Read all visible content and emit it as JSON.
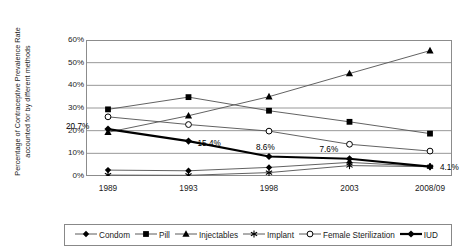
{
  "chart_data": {
    "type": "line",
    "title": "",
    "xlabel": "",
    "ylabel": "Percentage of Contraceptive Prevalence Rate accounted for by different methods",
    "ylabel_line1": "Percentage of Contraceptive Prevalence Rate",
    "ylabel_line2": "accounted for by different methods",
    "categories": [
      "1989",
      "1993",
      "1998",
      "2003",
      "2008/09"
    ],
    "ylim": [
      0,
      60
    ],
    "ytick_values": [
      0,
      10,
      20,
      30,
      40,
      50,
      60
    ],
    "ytick_labels": [
      "0%",
      "10%",
      "20%",
      "30%",
      "40%",
      "50%",
      "60%"
    ],
    "grid": true,
    "legend_position": "bottom",
    "series": [
      {
        "name": "Condom",
        "marker": "diamond",
        "values": [
          2.6,
          2.3,
          3.8,
          6.0,
          4.1
        ]
      },
      {
        "name": "Pill",
        "marker": "square",
        "values": [
          29.4,
          34.8,
          28.8,
          23.9,
          18.7
        ]
      },
      {
        "name": "Injectables",
        "marker": "triangle",
        "values": [
          19.3,
          26.6,
          35.0,
          45.2,
          55.3
        ]
      },
      {
        "name": "Implant",
        "marker": "asterisk",
        "values": [
          0.4,
          0.3,
          1.5,
          4.6,
          4.1
        ]
      },
      {
        "name": "Female Sterilization",
        "marker": "open-circle",
        "values": [
          26.1,
          22.7,
          19.8,
          14.0,
          11.0
        ]
      },
      {
        "name": "IUD",
        "marker": "bold-diamond",
        "values": [
          20.7,
          15.4,
          8.6,
          7.6,
          4.1
        ]
      }
    ],
    "annotations": [
      {
        "text": "20.7%",
        "series": "IUD",
        "category": "1989"
      },
      {
        "text": "15.4%",
        "series": "IUD",
        "category": "1993"
      },
      {
        "text": "8.6%",
        "series": "IUD",
        "category": "1998"
      },
      {
        "text": "7.6%",
        "series": "IUD",
        "category": "2003"
      },
      {
        "text": "4.1%",
        "series": "IUD",
        "category": "2008/09"
      }
    ]
  },
  "colors": {
    "line": "#5a5a5a",
    "emphasis_line": "#000000",
    "grid": "#8c8c8c",
    "axis": "#6e6e6e",
    "text": "#1a1a1a",
    "legend_border": "#888888",
    "background": "#ffffff"
  }
}
